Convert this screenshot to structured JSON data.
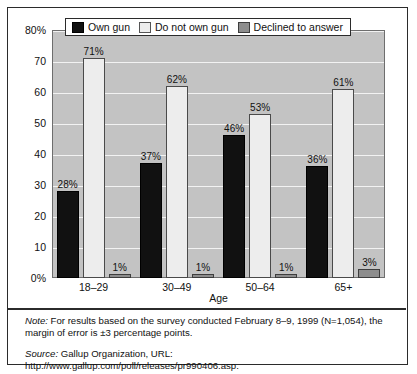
{
  "chart_data": {
    "type": "bar",
    "title": "",
    "xlabel": "Age",
    "ylabel": "",
    "ylim": [
      0,
      80
    ],
    "yticks": [
      0,
      10,
      20,
      30,
      40,
      50,
      60,
      70,
      80
    ],
    "ytick_labels": [
      "0%",
      "10",
      "20",
      "30",
      "40",
      "50",
      "60",
      "70",
      "80%"
    ],
    "grid": true,
    "legend_position": "top-center",
    "categories": [
      "18–29",
      "30–49",
      "50–64",
      "65+"
    ],
    "series": [
      {
        "name": "Own gun",
        "color": "#111111",
        "values": [
          28,
          37,
          46,
          36
        ],
        "labels": [
          "28%",
          "37%",
          "46%",
          "36%"
        ]
      },
      {
        "name": "Do not own gun",
        "color": "#ededed",
        "values": [
          71,
          62,
          53,
          61
        ],
        "labels": [
          "71%",
          "62%",
          "53%",
          "61%"
        ]
      },
      {
        "name": "Declined to answer",
        "color": "#8d8d8d",
        "values": [
          1,
          1,
          1,
          3
        ],
        "labels": [
          "1%",
          "1%",
          "1%",
          "3%"
        ]
      }
    ]
  },
  "legend": {
    "items": [
      {
        "label": "Own gun",
        "swatch": "own"
      },
      {
        "label": "Do not own gun",
        "swatch": "notown"
      },
      {
        "label": "Declined to answer",
        "swatch": "declined"
      }
    ]
  },
  "notes": {
    "note_lead": "Note:",
    "note_text": " For results based on the survey conducted February 8–9, 1999 (N=1,054), the margin of error is ±3 percentage points.",
    "source_lead": "Source:",
    "source_text": " Gallup Organization, URL: http://www.gallup.com/poll/releases/pr990406.asp."
  },
  "colors": {
    "plot_background": "#c3c3c3",
    "gridline": "#f2f2f2",
    "frame": "#2b2b2b",
    "own_gun": "#111111",
    "do_not_own_gun": "#ededed",
    "declined": "#8d8d8d"
  }
}
